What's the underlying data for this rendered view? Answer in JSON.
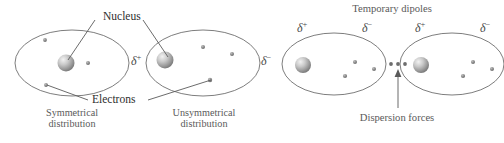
{
  "figure": {
    "type": "diagram",
    "background_color": "#ffffff",
    "ink_color": "#4a4a4a",
    "text_color": "#2e2e2e"
  },
  "labels": {
    "nucleus": "Nucleus",
    "electrons": "Electrons",
    "temporary_dipoles": "Temporary dipoles",
    "dispersion_forces": "Dispersion forces",
    "symmetrical_line1": "Symmetrical",
    "symmetrical_line2": "distribution",
    "unsymmetrical_line1": "Unsymmetrical",
    "unsymmetrical_line2": "distribution",
    "delta_symbol": "δ",
    "delta_plus_sign": "+",
    "delta_minus_sign": "−"
  },
  "panels": [
    {
      "id": "left-panel",
      "caption": "Symmetrical distribution",
      "atoms": [
        {
          "id": "atom-symmetrical",
          "nucleus_position": "center",
          "electron_count": 3,
          "polarity_labels": []
        },
        {
          "id": "atom-unsymmetrical",
          "nucleus_position": "left",
          "electron_count": 3,
          "polarity_labels": [
            "delta-plus",
            "delta-minus"
          ]
        }
      ]
    },
    {
      "id": "right-panel",
      "caption": "Temporary dipoles",
      "atoms": [
        {
          "id": "atom-dipole-1",
          "nucleus_position": "left",
          "electron_count": 3,
          "polarity_labels": [
            "delta-plus",
            "delta-minus"
          ]
        },
        {
          "id": "atom-dipole-2",
          "nucleus_position": "left",
          "electron_count": 3,
          "polarity_labels": [
            "delta-plus",
            "delta-minus"
          ]
        }
      ],
      "interaction_dots": 3
    }
  ]
}
